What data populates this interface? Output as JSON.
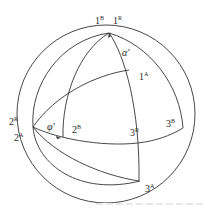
{
  "figure": {
    "type": "stereographic/spherical projection diagram",
    "labels": {
      "p1B": {
        "base": "1",
        "sup": "B"
      },
      "p1R": {
        "base": "1",
        "sup": "R"
      },
      "p1A": {
        "base": "1",
        "sup": "A"
      },
      "p2R": {
        "base": "2",
        "sup": "R"
      },
      "p2A": {
        "base": "2",
        "sup": "A"
      },
      "p2B": {
        "base": "2",
        "sup": "B"
      },
      "p3Bmid": {
        "base": "3",
        "sup": "R"
      },
      "p3Bright": {
        "base": "3",
        "sup": "B"
      },
      "p3A": {
        "base": "3",
        "sup": "A"
      }
    },
    "angles": {
      "alpha": "α′",
      "phi": "φ′"
    },
    "colors": {
      "line": "#333333",
      "text": "#2a2a2a",
      "background": "#ffffff"
    }
  }
}
